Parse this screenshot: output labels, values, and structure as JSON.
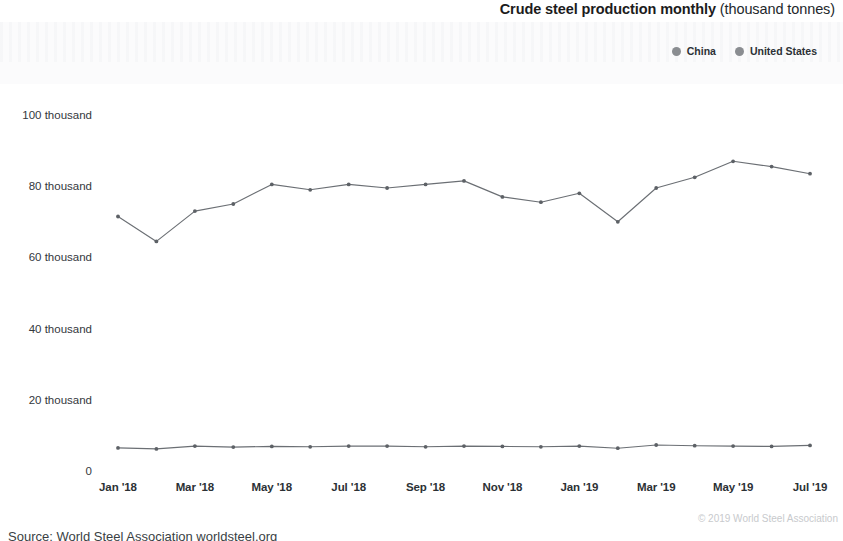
{
  "header": {
    "title_strong": "Crude steel production monthly",
    "title_light": " (thousand tonnes)"
  },
  "legend": {
    "position": "top-right",
    "marker_color": "#8a8d91",
    "items": [
      {
        "label": "China",
        "color": "#8a8d91"
      },
      {
        "label": "United States",
        "color": "#8a8d91"
      }
    ]
  },
  "footer": {
    "copyright": "© 2019 World Steel Association",
    "source": "Source: World Steel Association worldsteel.org"
  },
  "chart_data": {
    "type": "line",
    "title": "Crude steel production monthly (thousand tonnes)",
    "xlabel": "",
    "ylabel": "",
    "ylim": [
      0,
      100000
    ],
    "grid": false,
    "legend_position": "top-right",
    "y_tick_labels": [
      "0",
      "20 thousand",
      "40 thousand",
      "60 thousand",
      "80 thousand",
      "100 thousand"
    ],
    "y_tick_values": [
      0,
      20000,
      40000,
      60000,
      80000,
      100000
    ],
    "x": [
      "Jan '18",
      "Feb '18",
      "Mar '18",
      "Apr '18",
      "May '18",
      "Jun '18",
      "Jul '18",
      "Aug '18",
      "Sep '18",
      "Oct '18",
      "Nov '18",
      "Dec '18",
      "Jan '19",
      "Feb '19",
      "Mar '19",
      "Apr '19",
      "May '19",
      "Jun '19",
      "Jul '19"
    ],
    "x_tick_labels": [
      "Jan '18",
      "Mar '18",
      "May '18",
      "Jul '18",
      "Sep '18",
      "Nov '18",
      "Jan '19",
      "Mar '19",
      "May '19",
      "Jul '19"
    ],
    "series": [
      {
        "name": "China",
        "color": "#6b6f74",
        "values": [
          71500,
          64500,
          73000,
          75000,
          80500,
          79000,
          80500,
          79500,
          80500,
          81500,
          77000,
          75500,
          78000,
          70000,
          79500,
          82500,
          87000,
          85500,
          83500
        ]
      },
      {
        "name": "United States",
        "color": "#6b6f74",
        "values": [
          6500,
          6200,
          7000,
          6700,
          6900,
          6800,
          7000,
          7000,
          6800,
          7000,
          6900,
          6800,
          7000,
          6400,
          7300,
          7100,
          7000,
          6900,
          7200
        ]
      }
    ]
  }
}
